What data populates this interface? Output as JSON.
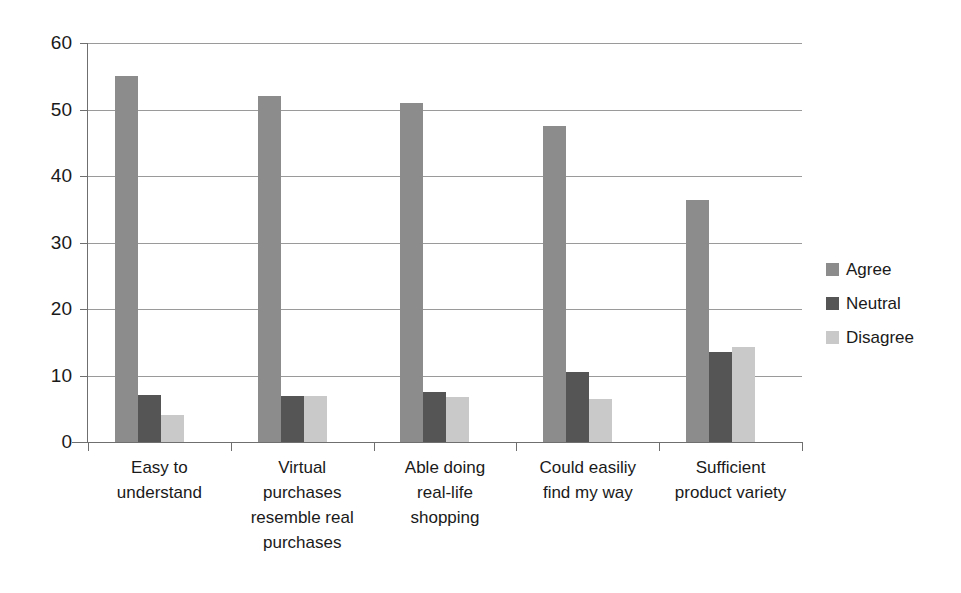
{
  "chart_data": {
    "type": "bar",
    "title": "",
    "subtitle": "",
    "xlabel": "",
    "ylabel": "",
    "ylim": [
      0,
      60
    ],
    "yticks": [
      0,
      10,
      20,
      30,
      40,
      50,
      60
    ],
    "grid": true,
    "legend_position": "right",
    "categories": [
      "Easy to understand",
      "Virtual purchases resemble real purchases",
      "Able doing real-life shopping",
      "Could easiliy find my way",
      "Sufficient product variety"
    ],
    "category_lines": [
      [
        "Easy to",
        "understand"
      ],
      [
        "Virtual",
        "purchases",
        "resemble real",
        "purchases"
      ],
      [
        "Able doing",
        "real-life",
        "shopping"
      ],
      [
        "Could easiliy",
        "find my way"
      ],
      [
        "Sufficient",
        "product variety"
      ]
    ],
    "series": [
      {
        "name": "Agree",
        "color": "#8c8c8c",
        "values": [
          55.0,
          52.0,
          51.0,
          47.5,
          36.4
        ]
      },
      {
        "name": "Neutral",
        "color": "#555555",
        "values": [
          7.0,
          6.9,
          7.5,
          10.6,
          13.5
        ]
      },
      {
        "name": "Disagree",
        "color": "#c9c9c9",
        "values": [
          4.0,
          6.9,
          6.8,
          6.5,
          14.3
        ]
      }
    ]
  },
  "legend": {
    "items": [
      {
        "label": "Agree"
      },
      {
        "label": "Neutral"
      },
      {
        "label": "Disagree"
      }
    ]
  },
  "axis": {
    "y_tick_labels": [
      "60",
      "50",
      "40",
      "30",
      "20",
      "10",
      "0"
    ]
  }
}
